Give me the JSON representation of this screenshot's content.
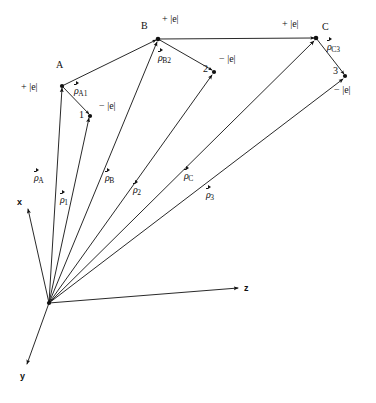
{
  "figure": {
    "width": 376,
    "height": 403,
    "background": "#ffffff",
    "ink": "#111111"
  },
  "origin": {
    "x": 49,
    "y": 303
  },
  "axes": [
    {
      "name": "x",
      "label": "x",
      "tip": {
        "x": 28,
        "y": 209
      },
      "label_pos": {
        "x": 17,
        "y": 202
      }
    },
    {
      "name": "y",
      "label": "y",
      "tip": {
        "x": 27,
        "y": 364
      },
      "label_pos": {
        "x": 20,
        "y": 374
      }
    },
    {
      "name": "z",
      "label": "z",
      "tip": {
        "x": 238,
        "y": 288
      },
      "label_pos": {
        "x": 244,
        "y": 283
      }
    }
  ],
  "vertices": [
    {
      "id": "A",
      "label": "A",
      "x": 62,
      "y": 86,
      "label_pos": {
        "x": 56,
        "y": 66
      },
      "charge": "+ |e|",
      "charge_pos": {
        "x": 21,
        "y": 81
      }
    },
    {
      "id": "1",
      "label": "1",
      "x": 90,
      "y": 116,
      "label_pos": {
        "x": 79,
        "y": 113
      },
      "charge": "− |e|",
      "charge_pos": {
        "x": 99,
        "y": 101
      }
    },
    {
      "id": "B",
      "label": "B",
      "x": 158,
      "y": 39,
      "label_pos": {
        "x": 142,
        "y": 26
      },
      "charge": "+ |e|",
      "charge_pos": {
        "x": 162,
        "y": 14
      }
    },
    {
      "id": "2",
      "label": "2",
      "x": 214,
      "y": 72,
      "label_pos": {
        "x": 203,
        "y": 68
      },
      "charge": "− |e|",
      "charge_pos": {
        "x": 219,
        "y": 54
      }
    },
    {
      "id": "C",
      "label": "C",
      "x": 316,
      "y": 38,
      "label_pos": {
        "x": 321,
        "y": 27
      },
      "charge": "+ |e|",
      "charge_pos": {
        "x": 282,
        "y": 19
      }
    },
    {
      "id": "3",
      "label": "3",
      "x": 345,
      "y": 76,
      "label_pos": {
        "x": 333,
        "y": 71
      },
      "charge": "− |e|",
      "charge_pos": {
        "x": 334,
        "y": 85
      }
    }
  ],
  "position_vectors": [
    {
      "name": "rho-A",
      "symbol": "ρ",
      "subscript": "A",
      "from": "origin",
      "to": "A",
      "label_pos": {
        "x": 34,
        "y": 172
      }
    },
    {
      "name": "rho-1",
      "symbol": "ρ",
      "subscript": "1",
      "from": "origin",
      "to": "1",
      "label_pos": {
        "x": 60,
        "y": 194
      }
    },
    {
      "name": "rho-B",
      "symbol": "ρ",
      "subscript": "B",
      "from": "origin",
      "to": "B",
      "label_pos": {
        "x": 105,
        "y": 172
      }
    },
    {
      "name": "rho-2",
      "symbol": "ρ",
      "subscript": "2",
      "from": "origin",
      "to": "2",
      "label_pos": {
        "x": 133,
        "y": 184
      }
    },
    {
      "name": "rho-C",
      "symbol": "ρ",
      "subscript": "C",
      "from": "origin",
      "to": "C",
      "label_pos": {
        "x": 184,
        "y": 170
      }
    },
    {
      "name": "rho-3",
      "symbol": "ρ",
      "subscript": "3",
      "from": "origin",
      "to": "3",
      "label_pos": {
        "x": 206,
        "y": 189
      }
    }
  ],
  "dipole_vectors": [
    {
      "name": "rho-A1",
      "symbol": "ρ",
      "subscript": "A1",
      "from": "A",
      "to": "1",
      "label_pos": {
        "x": 74,
        "y": 85
      }
    },
    {
      "name": "rho-B2",
      "symbol": "ρ",
      "subscript": "B2",
      "from": "B",
      "to": "2",
      "label_pos": {
        "x": 158,
        "y": 52
      }
    },
    {
      "name": "rho-C3",
      "symbol": "ρ",
      "subscript": "C3",
      "from": "C",
      "to": "3",
      "label_pos": {
        "x": 327,
        "y": 41
      }
    }
  ],
  "connectors": [
    {
      "name": "connector-A-B",
      "from": "A",
      "to": "B"
    },
    {
      "name": "connector-B-C",
      "from": "B",
      "to": "C"
    }
  ]
}
